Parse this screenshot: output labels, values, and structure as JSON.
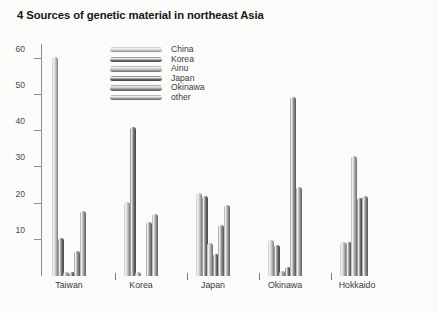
{
  "chart_data": {
    "type": "bar",
    "title": "4 Sources of genetic material in northeast Asia",
    "xlabel": "",
    "ylabel": "",
    "ylim": [
      0,
      64
    ],
    "grid": false,
    "legend_position": "top-left-inside",
    "categories": [
      "Taiwan",
      "Korea",
      "Japan",
      "Okinawa",
      "Hokkaido"
    ],
    "series": [
      {
        "name": "China",
        "color": "#c3c3c3",
        "values": [
          60.5,
          20.5,
          23.0,
          10.0,
          9.5
        ]
      },
      {
        "name": "Korea",
        "color": "#6e6e6e",
        "values": [
          10.5,
          41.0,
          22.0,
          8.5,
          9.5
        ]
      },
      {
        "name": "Ainu",
        "color": "#a8a8a8",
        "values": [
          1.0,
          1.0,
          9.0,
          1.5,
          33.0
        ]
      },
      {
        "name": "Japan",
        "color": "#5f5f5f",
        "values": [
          1.0,
          0.0,
          6.0,
          2.5,
          21.5
        ]
      },
      {
        "name": "Okinawa",
        "color": "#8a8a8a",
        "values": [
          7.0,
          15.0,
          14.0,
          49.5,
          22.0
        ]
      },
      {
        "name": "other",
        "color": "#9b9b9b",
        "values": [
          18.0,
          17.0,
          19.5,
          24.5,
          0.0
        ]
      }
    ],
    "yticks": [
      10,
      20,
      30,
      40,
      50,
      60
    ],
    "ytick_labels": [
      "10",
      "20",
      "30",
      "40",
      "50",
      "60"
    ]
  }
}
